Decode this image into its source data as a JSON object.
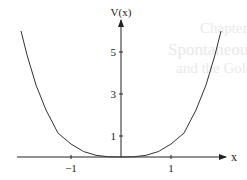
{
  "bleed_through_text": [
    "Chapter",
    "Spontaneous symmetry bre",
    "and the Goldstone Theorem"
  ],
  "chart_data": {
    "type": "line",
    "title": "",
    "xlabel": "x",
    "ylabel": "V(x)",
    "x_ticks": [
      {
        "value": -1,
        "label": "−1"
      },
      {
        "value": 1,
        "label": "1"
      }
    ],
    "y_ticks": [
      {
        "value": 1,
        "label": "1"
      },
      {
        "value": 3,
        "label": "3"
      },
      {
        "value": 5,
        "label": "5"
      }
    ],
    "xlim": [
      -2.08,
      2.1
    ],
    "ylim": [
      0,
      6.5
    ],
    "grid": false,
    "legend": null,
    "series": [
      {
        "name": "V(x)",
        "x": [
          -2.0,
          -1.88,
          -1.7,
          -1.5,
          -1.26,
          -1.0,
          -0.75,
          -0.5,
          -0.25,
          0,
          0.25,
          0.5,
          0.75,
          1.0,
          1.26,
          1.5,
          1.7,
          1.88,
          2.0
        ],
        "y": [
          6.0,
          4.86,
          3.43,
          2.24,
          1.14,
          0.62,
          0.26,
          0.08,
          0.01,
          0,
          0.01,
          0.08,
          0.26,
          0.62,
          1.14,
          2.24,
          3.43,
          4.86,
          6.0
        ]
      }
    ],
    "color": "#333333"
  }
}
